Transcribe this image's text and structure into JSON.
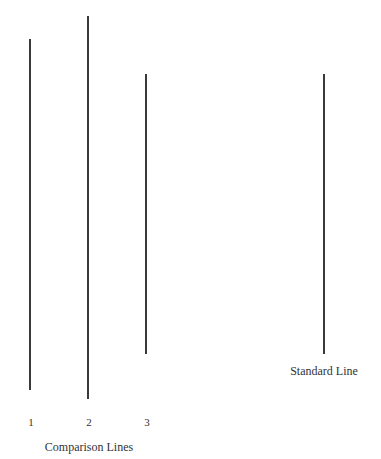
{
  "diagram": {
    "comparison_group": {
      "caption": "Comparison Lines",
      "lines": [
        {
          "label": "1",
          "x": 30,
          "y_top": 39,
          "y_bottom": 390
        },
        {
          "label": "2",
          "x": 88,
          "y_top": 16,
          "y_bottom": 399
        },
        {
          "label": "3",
          "x": 146,
          "y_top": 74,
          "y_bottom": 354
        }
      ]
    },
    "standard": {
      "caption": "Standard Line",
      "line": {
        "x": 324,
        "y_top": 74,
        "y_bottom": 354
      }
    },
    "colors": {
      "line": "#3a3a3a",
      "text": "#333333",
      "background": "#ffffff"
    }
  }
}
